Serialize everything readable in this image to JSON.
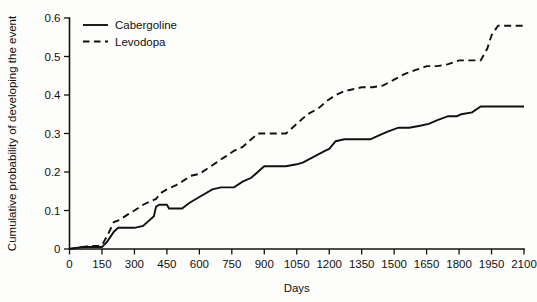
{
  "chart_data": {
    "type": "line",
    "title": "",
    "subtitle": "",
    "xlabel": "Days",
    "ylabel": "Cumulative probability of developing the event",
    "xlim": [
      0,
      2100
    ],
    "ylim": [
      0,
      0.6
    ],
    "grid": false,
    "legend_position": "top-left",
    "x_ticks": [
      0,
      150,
      300,
      450,
      600,
      750,
      900,
      1050,
      1200,
      1350,
      1500,
      1650,
      1800,
      1950,
      2100
    ],
    "x_tick_labels": [
      "0",
      "150",
      "300",
      "450",
      "600",
      "750",
      "900",
      "1050",
      "1200",
      "1350",
      "1500",
      "1650",
      "1800",
      "1950",
      "2100"
    ],
    "y_ticks": [
      0,
      0.1,
      0.2,
      0.3,
      0.4,
      0.5,
      0.6
    ],
    "y_tick_labels": [
      "0",
      "0.1",
      "0.2",
      "0.3",
      "0.4",
      "0.5",
      "0.6"
    ],
    "series": [
      {
        "name": "Cabergoline",
        "style": "solid",
        "color": "#111111",
        "final_value": 0.37,
        "x": [
          0,
          60,
          110,
          150,
          175,
          205,
          225,
          300,
          340,
          390,
          400,
          415,
          450,
          460,
          520,
          555,
          600,
          660,
          700,
          760,
          800,
          840,
          880,
          900,
          960,
          1000,
          1050,
          1080,
          1130,
          1180,
          1200,
          1230,
          1270,
          1290,
          1340,
          1390,
          1430,
          1470,
          1520,
          1570,
          1620,
          1660,
          1700,
          1750,
          1790,
          1810,
          1860,
          1900,
          1950,
          2000,
          2100
        ],
        "y": [
          0.0,
          0.005,
          0.005,
          0.005,
          0.02,
          0.045,
          0.055,
          0.055,
          0.06,
          0.085,
          0.11,
          0.115,
          0.115,
          0.105,
          0.105,
          0.12,
          0.135,
          0.155,
          0.16,
          0.16,
          0.175,
          0.185,
          0.205,
          0.215,
          0.215,
          0.215,
          0.22,
          0.225,
          0.24,
          0.255,
          0.26,
          0.28,
          0.285,
          0.285,
          0.285,
          0.285,
          0.295,
          0.305,
          0.315,
          0.315,
          0.32,
          0.325,
          0.335,
          0.345,
          0.345,
          0.35,
          0.355,
          0.37,
          0.37,
          0.37,
          0.37
        ]
      },
      {
        "name": "Levodopa",
        "style": "dashed",
        "color": "#111111",
        "final_value": 0.58,
        "x": [
          0,
          55,
          95,
          130,
          150,
          175,
          205,
          230,
          270,
          300,
          340,
          380,
          400,
          420,
          450,
          490,
          520,
          560,
          600,
          640,
          680,
          720,
          760,
          800,
          840,
          870,
          900,
          950,
          1000,
          1030,
          1060,
          1100,
          1150,
          1190,
          1230,
          1270,
          1310,
          1350,
          1400,
          1450,
          1500,
          1550,
          1600,
          1650,
          1700,
          1750,
          1800,
          1850,
          1900,
          1930,
          1950,
          1980,
          2040,
          2100
        ],
        "y": [
          0.0,
          0.005,
          0.008,
          0.008,
          0.01,
          0.035,
          0.07,
          0.075,
          0.09,
          0.1,
          0.115,
          0.125,
          0.13,
          0.145,
          0.155,
          0.165,
          0.175,
          0.19,
          0.195,
          0.21,
          0.225,
          0.24,
          0.255,
          0.265,
          0.285,
          0.3,
          0.3,
          0.3,
          0.3,
          0.315,
          0.33,
          0.35,
          0.365,
          0.385,
          0.4,
          0.41,
          0.415,
          0.42,
          0.42,
          0.425,
          0.44,
          0.455,
          0.465,
          0.475,
          0.475,
          0.48,
          0.49,
          0.49,
          0.49,
          0.52,
          0.555,
          0.58,
          0.58,
          0.58
        ]
      }
    ],
    "legend": [
      {
        "label": "Cabergoline",
        "style": "solid"
      },
      {
        "label": "Levodopa",
        "style": "dashed"
      }
    ]
  }
}
